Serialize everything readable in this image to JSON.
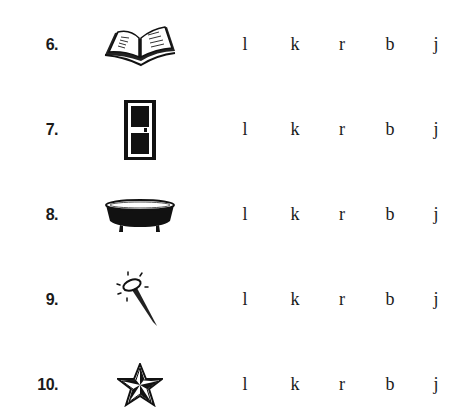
{
  "worksheet": {
    "letter_choices": [
      "l",
      "k",
      "r",
      "b",
      "j"
    ],
    "items": [
      {
        "number": "6.",
        "picture": "open-book",
        "choices": [
          "l",
          "k",
          "r",
          "b",
          "j"
        ]
      },
      {
        "number": "7.",
        "picture": "door",
        "choices": [
          "l",
          "k",
          "r",
          "b",
          "j"
        ]
      },
      {
        "number": "8.",
        "picture": "bathtub",
        "choices": [
          "l",
          "k",
          "r",
          "b",
          "j"
        ]
      },
      {
        "number": "9.",
        "picture": "nail",
        "choices": [
          "l",
          "k",
          "r",
          "b",
          "j"
        ]
      },
      {
        "number": "10.",
        "picture": "star",
        "choices": [
          "l",
          "k",
          "r",
          "b",
          "j"
        ]
      }
    ]
  }
}
